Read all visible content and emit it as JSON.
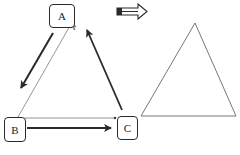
{
  "diagram": {
    "left": {
      "nodes": [
        {
          "id": "A",
          "label": "A"
        },
        {
          "id": "B",
          "label": "B"
        },
        {
          "id": "C",
          "label": "C"
        }
      ],
      "edges": [
        {
          "from": "A",
          "to": "B",
          "style": "thick-arrow"
        },
        {
          "from": "B",
          "to": "C",
          "style": "thick-arrow"
        },
        {
          "from": "C",
          "to": "A",
          "style": "thick-arrow"
        },
        {
          "from": "B",
          "to": "A",
          "style": "thin-line"
        },
        {
          "from": "B",
          "to": "C",
          "style": "thin-line"
        }
      ]
    },
    "transition_icon": "block-arrow-right-icon",
    "right": {
      "shape": "triangle",
      "style": "outline"
    },
    "colors": {
      "stroke": "#2a2a2a",
      "thin": "#888888",
      "background": "#ffffff"
    }
  }
}
